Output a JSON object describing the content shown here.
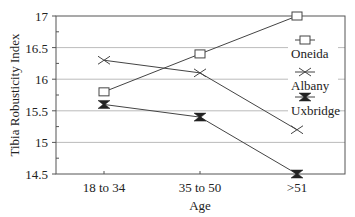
{
  "chart_data": {
    "type": "line",
    "title": "",
    "xlabel": "Age",
    "ylabel": "Tibia Robusticity Index",
    "categories": [
      "18 to 34",
      "35 to 50",
      ">51"
    ],
    "ylim": [
      14.5,
      17
    ],
    "yticks": [
      14.5,
      15,
      15.5,
      16,
      16.5,
      17
    ],
    "ytick_labels": [
      "14.5",
      "15",
      "15.5",
      "16",
      "16.5",
      "17"
    ],
    "grid": true,
    "legend_position": "right-inside",
    "series": [
      {
        "name": "Oneida",
        "marker": "square",
        "values": [
          15.8,
          16.4,
          17.0
        ]
      },
      {
        "name": "Albany",
        "marker": "x",
        "values": [
          16.3,
          16.1,
          15.2
        ]
      },
      {
        "name": "Uxbridge",
        "marker": "hourglass",
        "values": [
          15.6,
          15.4,
          14.5
        ]
      }
    ]
  },
  "colors": {
    "line": "#444444",
    "grid": "#aaaaaa",
    "axis": "#555555",
    "text": "#222222"
  }
}
